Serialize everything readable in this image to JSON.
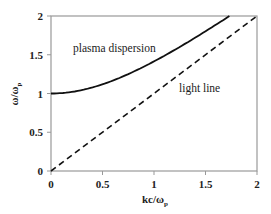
{
  "chart_data": {
    "type": "line",
    "title": "",
    "xlabel": "kc/ω_p",
    "ylabel": "ω/ω_p",
    "xlim": [
      0,
      2
    ],
    "ylim": [
      0,
      2
    ],
    "x_ticks": [
      "0",
      "0.5",
      "1",
      "1.5",
      "2"
    ],
    "y_ticks": [
      "0",
      "0.5",
      "1",
      "1.5",
      "2"
    ],
    "grid": false,
    "legend": "none (inline annotations)",
    "series": [
      {
        "name": "plasma dispersion",
        "style": "solid",
        "x": [
          0,
          0.25,
          0.5,
          0.75,
          1.0,
          1.25,
          1.5,
          1.732
        ],
        "values": [
          1.0,
          1.03,
          1.118,
          1.25,
          1.414,
          1.601,
          1.803,
          2.0
        ]
      },
      {
        "name": "light line",
        "style": "dashed",
        "x": [
          0,
          0.5,
          1.0,
          1.5,
          2.0
        ],
        "values": [
          0,
          0.5,
          1.0,
          1.5,
          2.0
        ]
      }
    ],
    "annotations": [
      "plasma dispersion",
      "light line"
    ]
  },
  "labels": {
    "x_axis_main": "kc/ω",
    "x_axis_sub": "p",
    "y_axis_main": "ω/ω",
    "y_axis_sub": "p",
    "anno_plasma": "plasma dispersion",
    "anno_light": "light line",
    "xt0": "0",
    "xt1": "0.5",
    "xt2": "1",
    "xt3": "1.5",
    "xt4": "2",
    "yt0": "0",
    "yt1": "0.5",
    "yt2": "1",
    "yt3": "1.5",
    "yt4": "2"
  }
}
